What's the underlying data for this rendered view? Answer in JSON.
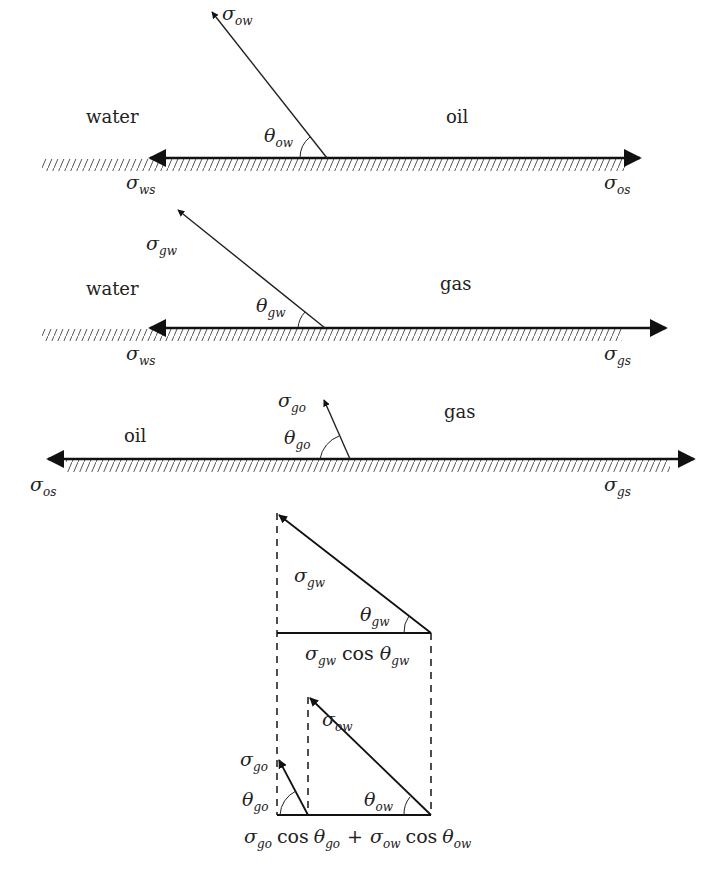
{
  "figure": {
    "type": "contact-angle force balance diagram",
    "panels": [
      {
        "id": "water-oil",
        "left_phase": "water",
        "right_phase": "oil",
        "tension_between_fluids": {
          "symbol": "σ",
          "sub": "ow"
        },
        "angle": {
          "symbol": "θ",
          "sub": "ow"
        },
        "left_solid_tension": {
          "symbol": "σ",
          "sub": "ws"
        },
        "right_solid_tension": {
          "symbol": "σ",
          "sub": "os"
        }
      },
      {
        "id": "water-gas",
        "left_phase": "water",
        "right_phase": "gas",
        "tension_between_fluids": {
          "symbol": "σ",
          "sub": "gw"
        },
        "angle": {
          "symbol": "θ",
          "sub": "gw"
        },
        "left_solid_tension": {
          "symbol": "σ",
          "sub": "ws"
        },
        "right_solid_tension": {
          "symbol": "σ",
          "sub": "gs"
        }
      },
      {
        "id": "oil-gas",
        "left_phase": "oil",
        "right_phase": "gas",
        "tension_between_fluids": {
          "symbol": "σ",
          "sub": "go"
        },
        "angle": {
          "symbol": "θ",
          "sub": "go"
        },
        "left_solid_tension": {
          "symbol": "σ",
          "sub": "os"
        },
        "right_solid_tension": {
          "symbol": "σ",
          "sub": "gs"
        }
      }
    ],
    "projection": {
      "top_triangle": {
        "hyp": {
          "symbol": "σ",
          "sub": "gw"
        },
        "angle": {
          "symbol": "θ",
          "sub": "gw"
        },
        "base_label": {
          "a": "σ",
          "a_sub": "gw",
          "cos": "cos",
          "b": "θ",
          "b_sub": "gw"
        }
      },
      "bottom": {
        "small_vec": {
          "symbol": "σ",
          "sub": "go"
        },
        "small_angle": {
          "symbol": "θ",
          "sub": "go"
        },
        "big_vec": {
          "symbol": "σ",
          "sub": "ow"
        },
        "big_angle": {
          "symbol": "θ",
          "sub": "ow"
        },
        "sum_label": {
          "a": "σ",
          "a_sub": "go",
          "cos1": "cos",
          "b": "θ",
          "b_sub": "go",
          "plus": "+",
          "c": "σ",
          "c_sub": "ow",
          "cos2": "cos",
          "d": "θ",
          "d_sub": "ow"
        }
      }
    }
  }
}
